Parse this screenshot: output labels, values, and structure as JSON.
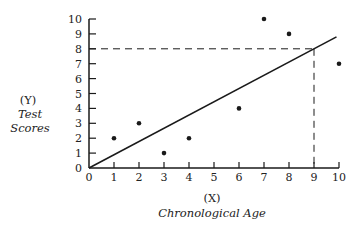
{
  "chart_data": {
    "type": "scatter",
    "title": "",
    "xlabel_prefix": "(X)",
    "xlabel": "Chronological Age",
    "ylabel_prefix": "(Y)",
    "ylabel_line1": "Test",
    "ylabel_line2": "Scores",
    "xlim": [
      0,
      10
    ],
    "ylim": [
      0,
      10
    ],
    "x_ticks": [
      "0",
      "1",
      "2",
      "3",
      "4",
      "5",
      "6",
      "7",
      "8",
      "9",
      "10"
    ],
    "y_ticks": [
      "0",
      "1",
      "2",
      "3",
      "4",
      "5",
      "6",
      "7",
      "8",
      "9",
      "10"
    ],
    "grid": false,
    "points": [
      {
        "x": 1,
        "y": 2
      },
      {
        "x": 2,
        "y": 3
      },
      {
        "x": 3,
        "y": 1
      },
      {
        "x": 4,
        "y": 2
      },
      {
        "x": 6,
        "y": 4
      },
      {
        "x": 7,
        "y": 10
      },
      {
        "x": 8,
        "y": 9
      },
      {
        "x": 10,
        "y": 7
      }
    ],
    "regression_line": {
      "x1": 0,
      "y1": 0,
      "x2": 9.9,
      "y2": 8.8
    },
    "guide_lines": {
      "x": 9,
      "y": 8,
      "style": "dashed"
    },
    "colors": {
      "ink": "#1a1a1a"
    }
  }
}
